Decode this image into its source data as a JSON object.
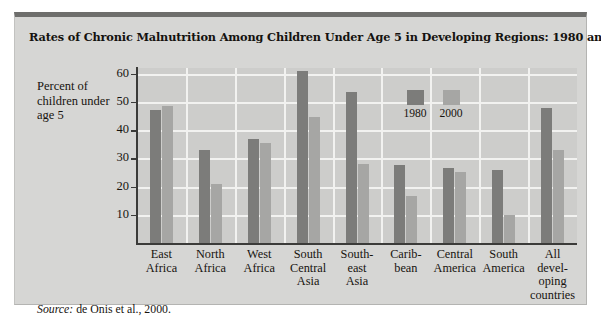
{
  "chart_data": {
    "type": "bar",
    "title": "Rates of Chronic Malnutrition Among Children Under Age 5 in Developing Regions: 1980 and 2000",
    "ylabel": "Percent of children under age 5",
    "xlabel": "",
    "ylim": [
      0,
      62
    ],
    "yticks": [
      10,
      20,
      30,
      40,
      50,
      60
    ],
    "grid": true,
    "legend_position": "inside-top-right",
    "categories": [
      "East Africa",
      "North Africa",
      "West Africa",
      "South Central Asia",
      "Southeast Asia",
      "Caribbean",
      "Central America",
      "South America",
      "All developing countries"
    ],
    "category_lines": [
      [
        "East",
        "Africa"
      ],
      [
        "North",
        "Africa"
      ],
      [
        "West",
        "Africa"
      ],
      [
        "South",
        "Central",
        "Asia"
      ],
      [
        "South-",
        "east",
        "Asia"
      ],
      [
        "Carib-",
        "bean"
      ],
      [
        "Central",
        "America"
      ],
      [
        "South",
        "America"
      ],
      [
        "All",
        "devel-",
        "oping",
        "countries"
      ]
    ],
    "series": [
      {
        "name": "1980",
        "color": "#7c7c7a",
        "values": [
          47,
          33,
          37,
          61,
          53.5,
          27.5,
          26.5,
          26,
          48
        ]
      },
      {
        "name": "2000",
        "color": "#a6a6a4",
        "values": [
          48.5,
          21,
          35.5,
          44.5,
          28,
          16.5,
          25,
          10,
          33
        ]
      }
    ],
    "source_label": "Source:",
    "source_text": "de Onis et al., 2000."
  },
  "colors": {
    "card_background": "#d6d6d4",
    "plot_background": "#cdcdcb",
    "gridline": "#f2f2f0",
    "axis": "#3b3b39",
    "card_top_border": "#6e6e6c",
    "text": "#17140f"
  }
}
